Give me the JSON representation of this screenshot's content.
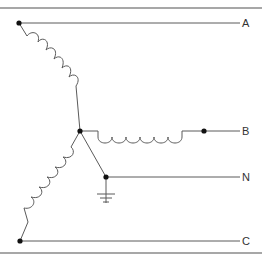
{
  "diagram": {
    "type": "wye-connected three-phase winding with grounded neutral",
    "terminals": {
      "a": "A",
      "b": "B",
      "n": "N",
      "c": "C"
    },
    "colors": {
      "line": "#555555",
      "border": "#888888",
      "node": "#111111",
      "label": "#333333"
    }
  }
}
